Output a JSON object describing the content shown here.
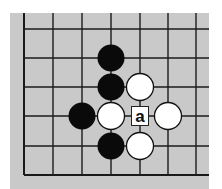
{
  "board": {
    "background": "#c9c9c9",
    "line_color": "#1a1a1a",
    "columns_x": [
      24,
      53,
      82,
      111,
      140,
      168,
      196
    ],
    "rows_y": [
      29,
      58,
      87,
      116,
      146,
      175
    ],
    "edges": {
      "left": true,
      "bottom": true,
      "top": false,
      "right": false
    },
    "stone_radius": 13.5
  },
  "stones": [
    {
      "color": "black",
      "col": 3,
      "row": 1
    },
    {
      "color": "black",
      "col": 3,
      "row": 2
    },
    {
      "color": "black",
      "col": 2,
      "row": 3
    },
    {
      "color": "black",
      "col": 3,
      "row": 4
    },
    {
      "color": "white",
      "col": 4,
      "row": 2
    },
    {
      "color": "white",
      "col": 3,
      "row": 3
    },
    {
      "color": "white",
      "col": 5,
      "row": 3
    },
    {
      "color": "white",
      "col": 4,
      "row": 4
    }
  ],
  "labels": [
    {
      "text": "a",
      "col": 4,
      "row": 3
    }
  ]
}
